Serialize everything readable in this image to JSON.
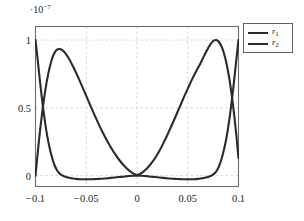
{
  "chart_data": {
    "type": "line",
    "title": "",
    "subtitle": "",
    "xlabel": "",
    "ylabel": "",
    "y_exponent_label": "·10⁻⁷",
    "y_exponent_mantissa": "·10",
    "y_exponent_power": "−7",
    "xlim": [
      -0.1,
      0.1
    ],
    "ylim": [
      -0.08,
      1.1
    ],
    "y_scale": 1e-07,
    "grid": true,
    "grid_style": "dashed",
    "legend_position": "outside-top-right",
    "xticks": [
      -0.1,
      -0.05,
      0,
      0.05,
      0.1
    ],
    "xticklabels": [
      "−0.1",
      "−0.05",
      "0",
      "0.05",
      "0.1"
    ],
    "yticks": [
      0,
      0.5,
      1
    ],
    "yticklabels": [
      "0",
      "0.5",
      "1"
    ],
    "series": [
      {
        "name": "r1",
        "label": "r",
        "label_sub": "1",
        "color": "#2b2b2b",
        "x": [
          -0.1,
          -0.0985,
          -0.097,
          -0.0955,
          -0.094,
          -0.0925,
          -0.091,
          -0.0895,
          -0.088,
          -0.0865,
          -0.085,
          -0.083,
          -0.081,
          -0.079,
          -0.077,
          -0.075,
          -0.072,
          -0.069,
          -0.066,
          -0.063,
          -0.06,
          -0.056,
          -0.052,
          -0.048,
          -0.044,
          -0.04,
          -0.036,
          -0.032,
          -0.028,
          -0.024,
          -0.02,
          -0.016,
          -0.012,
          -0.008,
          -0.004,
          0,
          0.004,
          0.008,
          0.012,
          0.016,
          0.02,
          0.024,
          0.028,
          0.032,
          0.036,
          0.04,
          0.044,
          0.048,
          0.052,
          0.056,
          0.06,
          0.063,
          0.066,
          0.069,
          0.072,
          0.075,
          0.077,
          0.079,
          0.081,
          0.083,
          0.085,
          0.0865,
          0.088,
          0.0895,
          0.091,
          0.0925,
          0.094,
          0.0955,
          0.097,
          0.0985,
          0.1
        ],
        "y": [
          1.0,
          0.9,
          0.795,
          0.69,
          0.59,
          0.5,
          0.415,
          0.34,
          0.275,
          0.218,
          0.17,
          0.115,
          0.073,
          0.042,
          0.021,
          0.008,
          -0.004,
          -0.012,
          -0.017,
          -0.021,
          -0.024,
          -0.026,
          -0.027,
          -0.027,
          -0.026,
          -0.025,
          -0.023,
          -0.021,
          -0.018,
          -0.015,
          -0.012,
          -0.009,
          -0.006,
          -0.003,
          -0.001,
          0.0,
          -0.001,
          -0.003,
          -0.006,
          -0.009,
          -0.012,
          -0.015,
          -0.018,
          -0.021,
          -0.023,
          -0.025,
          -0.026,
          -0.027,
          -0.027,
          -0.026,
          -0.024,
          -0.021,
          -0.017,
          -0.012,
          -0.004,
          0.008,
          0.021,
          0.042,
          0.073,
          0.115,
          0.17,
          0.218,
          0.275,
          0.34,
          0.415,
          0.5,
          0.59,
          0.69,
          0.795,
          0.9,
          1.0
        ]
      },
      {
        "name": "r2",
        "label": "r",
        "label_sub": "2",
        "color": "#2b2b2b",
        "x": [
          -0.1,
          -0.098,
          -0.096,
          -0.094,
          -0.092,
          -0.09,
          -0.088,
          -0.086,
          -0.084,
          -0.082,
          -0.08,
          -0.078,
          -0.076,
          -0.074,
          -0.072,
          -0.07,
          -0.068,
          -0.065,
          -0.062,
          -0.059,
          -0.056,
          -0.053,
          -0.05,
          -0.046,
          -0.042,
          -0.038,
          -0.034,
          -0.03,
          -0.026,
          -0.022,
          -0.018,
          -0.014,
          -0.01,
          -0.006,
          -0.003,
          0,
          0.003,
          0.006,
          0.01,
          0.014,
          0.018,
          0.022,
          0.026,
          0.03,
          0.034,
          0.038,
          0.042,
          0.046,
          0.05,
          0.053,
          0.056,
          0.059,
          0.062,
          0.065,
          0.068,
          0.07,
          0.072,
          0.074,
          0.076,
          0.078,
          0.08,
          0.082,
          0.084,
          0.086,
          0.088,
          0.09,
          0.092,
          0.094,
          0.096,
          0.098,
          0.1
        ],
        "y": [
          0.0,
          0.155,
          0.3,
          0.43,
          0.545,
          0.645,
          0.73,
          0.8,
          0.855,
          0.895,
          0.92,
          0.932,
          0.934,
          0.928,
          0.915,
          0.897,
          0.875,
          0.835,
          0.79,
          0.742,
          0.692,
          0.64,
          0.588,
          0.518,
          0.45,
          0.384,
          0.322,
          0.265,
          0.212,
          0.164,
          0.121,
          0.084,
          0.053,
          0.028,
          0.013,
          0.005,
          0.013,
          0.028,
          0.055,
          0.09,
          0.132,
          0.182,
          0.24,
          0.302,
          0.368,
          0.436,
          0.505,
          0.575,
          0.642,
          0.69,
          0.737,
          0.78,
          0.82,
          0.867,
          0.912,
          0.94,
          0.965,
          0.985,
          0.998,
          1.0,
          0.992,
          0.972,
          0.94,
          0.893,
          0.833,
          0.757,
          0.665,
          0.557,
          0.432,
          0.29,
          0.13
        ]
      }
    ],
    "legend": [
      {
        "label": "r",
        "sub": "1"
      },
      {
        "label": "r",
        "sub": "2"
      }
    ]
  },
  "axes": {
    "frame_color": "#6b6b6b",
    "grid_color": "#c9c9d6",
    "text_color": "#1a1a1a"
  }
}
